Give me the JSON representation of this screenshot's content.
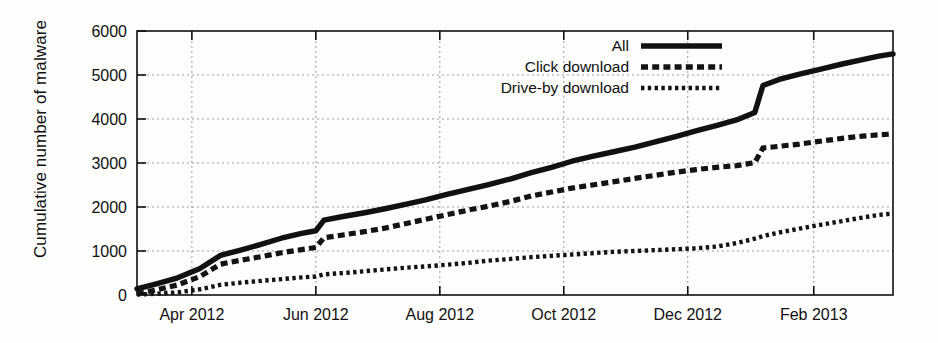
{
  "chart_data": {
    "type": "line",
    "title": "",
    "xlabel": "",
    "ylabel": "Cumulative number of malware",
    "ylim": [
      0,
      6000
    ],
    "yticks": [
      0,
      1000,
      2000,
      3000,
      4000,
      5000,
      6000
    ],
    "ytick_labels": [
      "0",
      "1000",
      "2000",
      "3000",
      "4000",
      "5000",
      "6000"
    ],
    "xtick_labels": [
      "Apr 2012",
      "Jun 2012",
      "Aug 2012",
      "Oct 2012",
      "Dec 2012",
      "Feb 2013"
    ],
    "x_unit": "month",
    "xlim": [
      "2012-03-05",
      "2013-03-12"
    ],
    "grid": true,
    "legend_position": "top-right-inside",
    "series": [
      {
        "name": "All",
        "style": "solid",
        "x": [
          "2012-03-05",
          "2012-03-15",
          "2012-03-25",
          "2012-04-05",
          "2012-04-15",
          "2012-04-25",
          "2012-05-05",
          "2012-05-15",
          "2012-05-25",
          "2012-06-01",
          "2012-06-05",
          "2012-06-15",
          "2012-06-25",
          "2012-07-05",
          "2012-07-15",
          "2012-07-25",
          "2012-08-05",
          "2012-08-15",
          "2012-08-25",
          "2012-09-05",
          "2012-09-15",
          "2012-09-25",
          "2012-10-05",
          "2012-10-15",
          "2012-10-25",
          "2012-11-05",
          "2012-11-15",
          "2012-11-25",
          "2012-12-05",
          "2012-12-15",
          "2012-12-25",
          "2013-01-03",
          "2013-01-07",
          "2013-01-15",
          "2013-01-25",
          "2013-02-05",
          "2013-02-15",
          "2013-02-25",
          "2013-03-05",
          "2013-03-12"
        ],
        "values": [
          140,
          260,
          390,
          600,
          900,
          1020,
          1150,
          1290,
          1400,
          1460,
          1700,
          1790,
          1870,
          1960,
          2060,
          2160,
          2290,
          2400,
          2510,
          2640,
          2780,
          2900,
          3040,
          3150,
          3250,
          3360,
          3480,
          3600,
          3730,
          3850,
          3980,
          4150,
          4760,
          4900,
          5020,
          5140,
          5250,
          5350,
          5430,
          5480
        ]
      },
      {
        "name": "Click download",
        "style": "dashed",
        "x": [
          "2012-03-05",
          "2012-03-15",
          "2012-03-25",
          "2012-04-05",
          "2012-04-15",
          "2012-04-25",
          "2012-05-05",
          "2012-05-15",
          "2012-05-25",
          "2012-06-01",
          "2012-06-05",
          "2012-06-15",
          "2012-06-25",
          "2012-07-05",
          "2012-07-15",
          "2012-07-25",
          "2012-08-05",
          "2012-08-15",
          "2012-08-25",
          "2012-09-05",
          "2012-09-15",
          "2012-09-25",
          "2012-10-05",
          "2012-10-15",
          "2012-10-25",
          "2012-11-05",
          "2012-11-15",
          "2012-11-25",
          "2012-12-05",
          "2012-12-15",
          "2012-12-25",
          "2013-01-03",
          "2013-01-07",
          "2013-01-15",
          "2013-01-25",
          "2013-02-05",
          "2013-02-15",
          "2013-02-25",
          "2013-03-05",
          "2013-03-12"
        ],
        "values": [
          30,
          120,
          230,
          420,
          700,
          790,
          870,
          960,
          1030,
          1080,
          1300,
          1370,
          1440,
          1520,
          1620,
          1720,
          1830,
          1930,
          2020,
          2130,
          2250,
          2340,
          2430,
          2500,
          2570,
          2650,
          2720,
          2790,
          2850,
          2900,
          2940,
          3010,
          3340,
          3380,
          3430,
          3500,
          3560,
          3610,
          3640,
          3660
        ]
      },
      {
        "name": "Drive-by download",
        "style": "dotted",
        "x": [
          "2012-03-05",
          "2012-03-15",
          "2012-03-25",
          "2012-04-05",
          "2012-04-15",
          "2012-04-25",
          "2012-05-05",
          "2012-05-15",
          "2012-05-25",
          "2012-06-01",
          "2012-06-05",
          "2012-06-15",
          "2012-06-25",
          "2012-07-05",
          "2012-07-15",
          "2012-07-25",
          "2012-08-05",
          "2012-08-15",
          "2012-08-25",
          "2012-09-05",
          "2012-09-15",
          "2012-09-25",
          "2012-10-05",
          "2012-10-15",
          "2012-10-25",
          "2012-11-05",
          "2012-11-15",
          "2012-11-25",
          "2012-12-05",
          "2012-12-15",
          "2012-12-25",
          "2013-01-03",
          "2013-01-07",
          "2013-01-15",
          "2013-01-25",
          "2013-02-05",
          "2013-02-15",
          "2013-02-25",
          "2013-03-05",
          "2013-03-12"
        ],
        "values": [
          10,
          30,
          60,
          130,
          230,
          280,
          320,
          360,
          400,
          420,
          470,
          500,
          540,
          580,
          620,
          650,
          690,
          730,
          780,
          820,
          860,
          890,
          920,
          950,
          980,
          1000,
          1020,
          1040,
          1060,
          1100,
          1180,
          1280,
          1340,
          1420,
          1510,
          1600,
          1680,
          1760,
          1820,
          1850
        ]
      }
    ]
  },
  "legend": {
    "items": [
      {
        "label": "All",
        "key": "solid-line-key"
      },
      {
        "label": "Click download",
        "key": "dashed-line-key"
      },
      {
        "label": "Drive-by download",
        "key": "dotted-line-key"
      }
    ]
  },
  "axes": {
    "y_title": "Cumulative number of malware"
  }
}
